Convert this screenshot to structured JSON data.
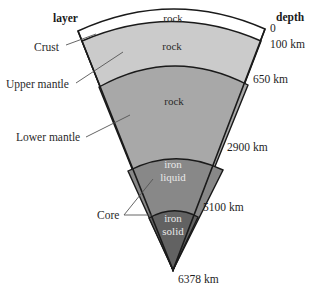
{
  "headers": {
    "layer": "layer",
    "depth": "depth"
  },
  "layers": [
    {
      "name": "Crust",
      "material": "rock",
      "color": "#ffffff"
    },
    {
      "name": "Upper mantle",
      "material": "rock",
      "color": "#c9c9c9"
    },
    {
      "name": "Lower mantle",
      "material": "rock",
      "color": "#a9a9a9"
    },
    {
      "name": "Core",
      "material": "iron liquid",
      "material_lines": [
        "iron",
        "liquid"
      ],
      "color": "#8a8a8a"
    },
    {
      "name": "Core",
      "material": "iron solid",
      "material_lines": [
        "iron",
        "solid"
      ],
      "color": "#666666"
    }
  ],
  "layer_labels": {
    "crust": "Crust",
    "upper_mantle": "Upper mantle",
    "lower_mantle": "Lower mantle",
    "core": "Core"
  },
  "materials": {
    "crust": "rock",
    "upper_mantle": "rock",
    "lower_mantle": "rock",
    "outer_core_line1": "iron",
    "outer_core_line2": "liquid",
    "inner_core_line1": "iron",
    "inner_core_line2": "solid"
  },
  "depths": {
    "surface": "0",
    "crust_base": "100 km",
    "upper_mantle_base": "650 km",
    "lower_mantle_base": "2900 km",
    "outer_core_base": "5100 km",
    "center": "6378 km"
  },
  "colors": {
    "crust": "#ffffff",
    "upper_mantle": "#cbcbcb",
    "lower_mantle": "#a8a8a8",
    "outer_core": "#888888",
    "inner_core": "#626262",
    "outline": "#1a1a1a",
    "leader": "#555555"
  }
}
